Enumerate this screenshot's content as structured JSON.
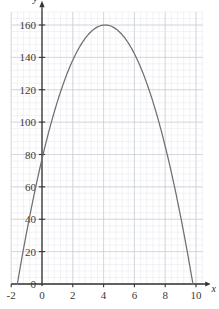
{
  "chart_data": {
    "type": "line",
    "title": "",
    "xlabel": "x",
    "ylabel": "y",
    "xlim": [
      -2,
      10.6
    ],
    "ylim": [
      -8,
      172
    ],
    "grid": true,
    "minor_grid": true,
    "major_x_step": 2,
    "minor_x_step": 0.4,
    "major_y_step": 20,
    "minor_y_step": 4,
    "legend": "none",
    "xticks": [
      -2,
      0,
      2,
      4,
      6,
      8,
      10
    ],
    "xtick_labels": [
      "-2",
      "0",
      "2",
      "4",
      "6",
      "8",
      "10"
    ],
    "yticks": [
      0,
      20,
      40,
      60,
      80,
      100,
      120,
      140,
      160
    ],
    "ytick_labels": [
      "0",
      "20",
      "40",
      "60",
      "80",
      "100",
      "120",
      "140",
      "160"
    ],
    "curve_color": "#6f6f6f",
    "grid_color": "#c9ccd6",
    "minor_grid_color": "#e4e6ec",
    "axis_color": "#333333",
    "series": [
      {
        "name": "parabola",
        "equation": "y = -5.1(x + 1.6)(x - 9.8)",
        "vertex": [
          4.1,
          160
        ],
        "y_intercept": 80,
        "roots": [
          -1.6,
          9.8
        ],
        "x": [
          -1.6,
          -1.2,
          -0.8,
          -0.4,
          0,
          0.4,
          0.8,
          1.2,
          1.6,
          2,
          2.4,
          2.8,
          3.2,
          3.6,
          4,
          4.4,
          4.8,
          5.2,
          5.6,
          6,
          6.4,
          6.8,
          7.2,
          7.6,
          8,
          8.4,
          8.8,
          9.2,
          9.6,
          9.8
        ],
        "y": [
          0,
          22.2,
          42.4,
          60.5,
          80,
          93,
          106,
          118,
          128,
          137,
          145,
          152,
          157,
          159,
          161,
          160,
          159,
          156,
          152,
          146,
          139,
          131,
          121,
          110,
          98,
          84,
          69,
          53,
          35,
          0
        ]
      }
    ]
  },
  "axis_labels": {
    "x": "x",
    "y": "y"
  }
}
